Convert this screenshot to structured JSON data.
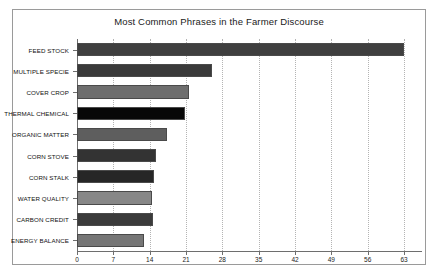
{
  "chart_data": {
    "type": "bar",
    "orientation": "horizontal",
    "title": "Most Common Phrases in the Farmer Discourse",
    "xlabel": "",
    "ylabel": "",
    "xlim": [
      0,
      63
    ],
    "grid": true,
    "legend": "none",
    "xticks": [
      "0",
      "7",
      "14",
      "21",
      "28",
      "35",
      "42",
      "49",
      "56",
      "63"
    ],
    "xtick_values": [
      0,
      7,
      14,
      21,
      28,
      35,
      42,
      49,
      56,
      63
    ],
    "categories": [
      "FEED STOCK",
      "MULTIPLE SPECIE",
      "COVER CROP",
      "THERMAL CHEMICAL",
      "ORGANIC MATTER",
      "CORN STOVE",
      "CORN STALK",
      "WATER QUALITY",
      "CARBON CREDIT",
      "ENERGY BALANCE"
    ],
    "values": [
      63,
      26,
      21.5,
      20.8,
      17.3,
      15.2,
      14.8,
      14.4,
      14.6,
      13
    ],
    "bar_colors": [
      "#3f3f3f",
      "#3a3a3a",
      "#6e6e6e",
      "#080808",
      "#5e5e5e",
      "#333333",
      "#262626",
      "#878787",
      "#3b3b3b",
      "#767676"
    ]
  },
  "frame": {
    "border_color": "#9a9a9a",
    "background": "#ffffff"
  }
}
